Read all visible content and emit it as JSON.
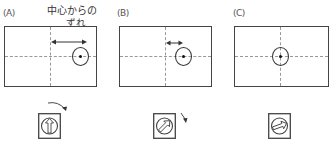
{
  "panels": [
    {
      "id": "A",
      "label": "(A)",
      "annotation_line1": "中心からの",
      "annotation_line2": "ずれ",
      "offset": "large",
      "knob_rotation_deg": 0,
      "rotate_hint": "clockwise"
    },
    {
      "id": "B",
      "label": "(B)",
      "offset": "small",
      "knob_rotation_deg": 45,
      "rotate_hint": "clockwise"
    },
    {
      "id": "C",
      "label": "(C)",
      "offset": "none",
      "knob_rotation_deg": 70
    }
  ],
  "colors": {
    "frame": "#444444",
    "guides": "#999999",
    "target": "#333333"
  }
}
